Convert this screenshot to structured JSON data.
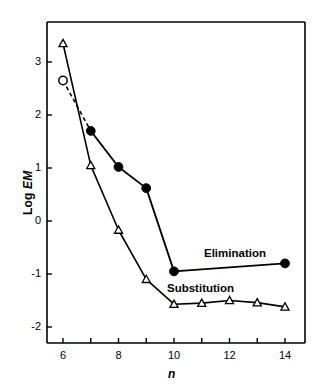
{
  "chart_data": {
    "type": "line",
    "title": "",
    "xlabel": "n",
    "ylabel": "Log EM",
    "xlim": [
      5.4,
      14.8
    ],
    "ylim": [
      -2.55,
      3.75
    ],
    "grid": false,
    "legend_position": "inline-annotation",
    "x_ticks_major": [
      6,
      8,
      10,
      12,
      14
    ],
    "x_ticks_minor": [
      7,
      9,
      11,
      13
    ],
    "x_tick_labels": [
      "6",
      "8",
      "10",
      "12",
      "14"
    ],
    "y_ticks": [
      3,
      2,
      1,
      0,
      -1,
      -2
    ],
    "y_tick_labels": [
      "3",
      "2",
      "1",
      "0",
      "-1",
      "-2"
    ],
    "series": [
      {
        "name": "Elimination",
        "marker": "filled-circle",
        "marker_color": "#000000",
        "line_color": "#000000",
        "x": [
          6,
          7,
          8,
          9,
          10,
          14
        ],
        "values": [
          2.65,
          1.7,
          1.02,
          0.62,
          -0.95,
          -0.8
        ],
        "first_point_marker": "open-circle",
        "first_segment_style": "dashed"
      },
      {
        "name": "Substitution",
        "marker": "open-triangle",
        "marker_color": "#000000",
        "line_color": "#000000",
        "x": [
          6,
          7,
          8,
          9,
          10,
          11,
          12,
          13,
          14
        ],
        "values": [
          3.35,
          1.05,
          -0.17,
          -1.1,
          -1.57,
          -1.55,
          -1.5,
          -1.54,
          -1.62
        ]
      }
    ],
    "annotations": [
      {
        "text": "Elimination",
        "x": 11.2,
        "y": -0.62
      },
      {
        "text": "Substitution",
        "x": 9.7,
        "y": -1.28
      }
    ],
    "colors": {
      "axis": "#000000",
      "ink": "#000000",
      "background": "#ffffff"
    }
  },
  "axes": {
    "x_title": "n",
    "y_title_prefix": "Log ",
    "y_title_italic": "EM"
  },
  "labels": {
    "x_ticks": [
      "6",
      "8",
      "10",
      "12",
      "14"
    ],
    "y_ticks": [
      "3",
      "2",
      "1",
      "0",
      "-1",
      "-2"
    ],
    "elimination": "Elimination",
    "substitution": "Substitution"
  }
}
